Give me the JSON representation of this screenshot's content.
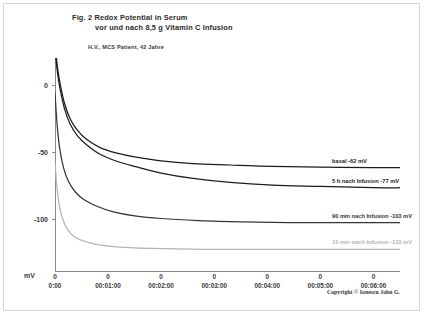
{
  "figure": {
    "title_line_1": "Fig. 2   Redox Potential in Serum",
    "title_line_2": "vor und nach 8,5 g Vitamin C Infusion",
    "patient": "H.V., MCS Patient, 42 Jahre",
    "copyright": "Copyright © Ionescu John G."
  },
  "chart_data": {
    "type": "line",
    "title": "Fig. 2   Redox Potential in Serum vor und nach 8,5 g Vitamin C Infusion",
    "subtitle": "H.V., MCS Patient, 42 Jahre",
    "xlabel": "",
    "ylabel": "mV",
    "ylim": [
      -140,
      20
    ],
    "xlim": [
      0,
      6.5
    ],
    "grid": false,
    "legend_position": "inline-right",
    "y_ticks": [
      {
        "label": "0",
        "value": 0
      },
      {
        "label": "-50",
        "value": -50
      },
      {
        "label": "-100",
        "value": -100
      }
    ],
    "x_ticks": [
      {
        "zero": "0",
        "label": "0:00",
        "value": 0
      },
      {
        "zero": "0",
        "label": "00:01:00",
        "value": 1
      },
      {
        "zero": "0",
        "label": "00:02:00",
        "value": 2
      },
      {
        "zero": "0",
        "label": "00:03:00",
        "value": 3
      },
      {
        "zero": "0",
        "label": "00:04:00",
        "value": 4
      },
      {
        "zero": "0",
        "label": "00:05:00",
        "value": 5
      },
      {
        "zero": "0",
        "label": "00:06:00",
        "value": 6
      }
    ],
    "series": [
      {
        "name": "basal",
        "label": "basal  -62 mV",
        "plateau_mv": -62,
        "color": "#1d1d1d",
        "x": [
          0.0,
          0.05,
          0.1,
          0.18,
          0.28,
          0.42,
          0.6,
          0.85,
          1.15,
          1.5,
          2.0,
          2.6,
          3.3,
          4.1,
          5.0,
          6.0,
          6.5
        ],
        "values": [
          30,
          12,
          0,
          -14,
          -25,
          -34,
          -41,
          -47,
          -51,
          -54,
          -57,
          -59,
          -60,
          -61,
          -61.5,
          -62,
          -62
        ]
      },
      {
        "name": "5 h nach Infusion",
        "label": "5 h nach Infusion -77 mV",
        "plateau_mv": -77,
        "color": "#1d1d1d",
        "x": [
          0.0,
          0.05,
          0.1,
          0.18,
          0.28,
          0.42,
          0.6,
          0.85,
          1.15,
          1.5,
          2.0,
          2.6,
          3.3,
          4.1,
          5.0,
          6.0,
          6.5
        ],
        "values": [
          26,
          8,
          -4,
          -18,
          -29,
          -38,
          -45,
          -52,
          -57,
          -61,
          -66,
          -70,
          -73,
          -75,
          -76,
          -77,
          -77
        ]
      },
      {
        "name": "90 min nach Infusion",
        "label": "90 min nach Infusion -103 mV",
        "plateau_mv": -103,
        "color": "#343434",
        "x": [
          0.0,
          0.04,
          0.09,
          0.16,
          0.25,
          0.38,
          0.55,
          0.8,
          1.1,
          1.5,
          2.0,
          2.7,
          3.5,
          4.4,
          5.4,
          6.5
        ],
        "values": [
          -6,
          -30,
          -48,
          -62,
          -72,
          -80,
          -86,
          -91,
          -95,
          -98,
          -100,
          -101.5,
          -102.5,
          -103,
          -103,
          -103
        ]
      },
      {
        "name": "15 min nach Infusion",
        "label": "15 min nach Infusion -123 mV",
        "plateau_mv": -123,
        "color": "#b4b4b4",
        "x": [
          0.0,
          0.04,
          0.09,
          0.16,
          0.25,
          0.38,
          0.55,
          0.8,
          1.1,
          1.5,
          2.0,
          2.7,
          3.5,
          4.4,
          5.4,
          6.5
        ],
        "values": [
          -58,
          -78,
          -92,
          -102,
          -109,
          -114,
          -117,
          -119.5,
          -121,
          -122,
          -122.5,
          -123,
          -123,
          -123,
          -123,
          -123
        ]
      }
    ]
  }
}
